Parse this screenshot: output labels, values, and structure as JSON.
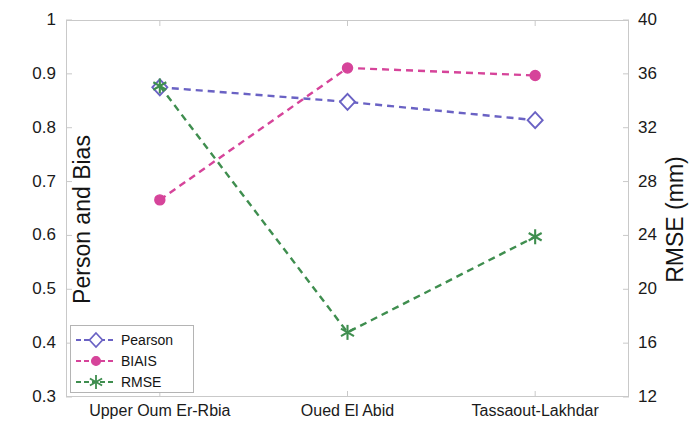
{
  "chart_data": {
    "type": "line",
    "title": "",
    "subtitle": "",
    "xlabel": "",
    "ylabel": "Person and Bias",
    "y2label": "RMSE (mm)",
    "categories": [
      "Upper Oum Er-Rbia",
      "Oued El Abid",
      "Tassaout-Lakhdar"
    ],
    "ylim": [
      0.3,
      1
    ],
    "y2lim": [
      12,
      40
    ],
    "yticks": [
      "0.3",
      "0.4",
      "0.5",
      "0.6",
      "0.7",
      "0.8",
      "0.9",
      "1"
    ],
    "ytick_values": [
      0.3,
      0.4,
      0.5,
      0.6,
      0.7,
      0.8,
      0.9,
      1
    ],
    "y2ticks": [
      "12",
      "16",
      "20",
      "24",
      "28",
      "32",
      "36",
      "40"
    ],
    "y2tick_values": [
      12,
      16,
      20,
      24,
      28,
      32,
      36,
      40
    ],
    "grid": false,
    "legend_position": "lower left",
    "series": [
      {
        "name": "Pearson",
        "axis": "left",
        "color": "#6a62c4",
        "marker": "diamond",
        "linestyle": "dashed",
        "values": [
          0.875,
          0.848,
          0.814
        ]
      },
      {
        "name": "BIAIS",
        "axis": "left",
        "color": "#d6449a",
        "marker": "circle",
        "linestyle": "dashed",
        "values": [
          0.666,
          0.911,
          0.897
        ]
      },
      {
        "name": "RMSE",
        "axis": "right",
        "color": "#3f8e4f",
        "marker": "asterisk",
        "linestyle": "dashed",
        "values": [
          35.1,
          16.8,
          23.9
        ]
      }
    ]
  },
  "legend": {
    "items": [
      {
        "label": "Pearson"
      },
      {
        "label": "BIAIS"
      },
      {
        "label": "RMSE"
      }
    ]
  },
  "colors": {
    "pearson": "#6a62c4",
    "biais": "#d6449a",
    "rmse": "#3f8e4f",
    "axis": "#c9c9c9",
    "text": "#141414"
  }
}
